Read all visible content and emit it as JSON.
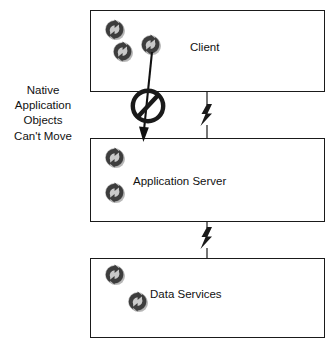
{
  "diagram": {
    "title": "Native Application Objects Can't Move",
    "note": {
      "lines": [
        "Native",
        "Application",
        "Objects",
        "Can't Move"
      ]
    },
    "tiers": [
      {
        "id": "client",
        "label": "Client",
        "object_icons": 3,
        "icon_name": "native-application-object-icon"
      },
      {
        "id": "application-server",
        "label": "Application Server",
        "object_icons": 2,
        "icon_name": "native-application-object-icon"
      },
      {
        "id": "data-services",
        "label": "Data Services",
        "object_icons": 2,
        "icon_name": "native-application-object-icon"
      }
    ],
    "connectors": [
      {
        "id": "client-to-appserver",
        "icon_name": "lightning-bolt-link-icon"
      },
      {
        "id": "appserver-to-dataservices",
        "icon_name": "lightning-bolt-link-icon"
      }
    ],
    "blocked_flow": {
      "id": "blocked-object-move",
      "icon_name": "prohibition-no-entry-icon",
      "arrow_icon_name": "down-arrow-icon"
    },
    "colors": {
      "stroke": "#1a1a1a",
      "fill": "#ffffff",
      "icon_dark": "#3d3d3d",
      "icon_light": "#c9c9c9",
      "icon_shadow": "#b4b4b4",
      "text": "#111111"
    }
  }
}
